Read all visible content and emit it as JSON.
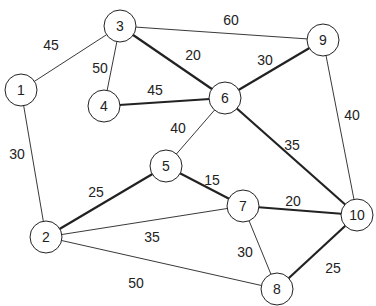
{
  "graph": {
    "nodes": [
      {
        "id": "1",
        "x": 21,
        "y": 90
      },
      {
        "id": "2",
        "x": 46,
        "y": 237
      },
      {
        "id": "3",
        "x": 120,
        "y": 26
      },
      {
        "id": "4",
        "x": 104,
        "y": 106
      },
      {
        "id": "5",
        "x": 166,
        "y": 166
      },
      {
        "id": "6",
        "x": 225,
        "y": 98
      },
      {
        "id": "7",
        "x": 243,
        "y": 206
      },
      {
        "id": "8",
        "x": 277,
        "y": 289
      },
      {
        "id": "9",
        "x": 323,
        "y": 40
      },
      {
        "id": "10",
        "x": 357,
        "y": 215
      }
    ],
    "edges": [
      {
        "from": "1",
        "to": "3",
        "weight": "45",
        "bold": false,
        "lx": 51,
        "ly": 45
      },
      {
        "from": "1",
        "to": "2",
        "weight": "30",
        "bold": false,
        "lx": 17,
        "ly": 154
      },
      {
        "from": "3",
        "to": "4",
        "weight": "50",
        "bold": false,
        "lx": 100,
        "ly": 68
      },
      {
        "from": "3",
        "to": "9",
        "weight": "60",
        "bold": false,
        "lx": 231,
        "ly": 20
      },
      {
        "from": "3",
        "to": "6",
        "weight": "20",
        "bold": true,
        "lx": 193,
        "ly": 55
      },
      {
        "from": "4",
        "to": "6",
        "weight": "45",
        "bold": true,
        "lx": 155,
        "ly": 90
      },
      {
        "from": "6",
        "to": "9",
        "weight": "30",
        "bold": true,
        "lx": 265,
        "ly": 60
      },
      {
        "from": "6",
        "to": "5",
        "weight": "40",
        "bold": false,
        "lx": 178,
        "ly": 128
      },
      {
        "from": "6",
        "to": "10",
        "weight": "35",
        "bold": true,
        "lx": 292,
        "ly": 145
      },
      {
        "from": "9",
        "to": "10",
        "weight": "40",
        "bold": false,
        "lx": 352,
        "ly": 115
      },
      {
        "from": "2",
        "to": "5",
        "weight": "25",
        "bold": true,
        "lx": 96,
        "ly": 192
      },
      {
        "from": "5",
        "to": "7",
        "weight": "15",
        "bold": true,
        "lx": 212,
        "ly": 180
      },
      {
        "from": "2",
        "to": "7",
        "weight": "35",
        "bold": false,
        "lx": 152,
        "ly": 237
      },
      {
        "from": "2",
        "to": "8",
        "weight": "50",
        "bold": false,
        "lx": 136,
        "ly": 283
      },
      {
        "from": "7",
        "to": "10",
        "weight": "20",
        "bold": true,
        "lx": 293,
        "ly": 201
      },
      {
        "from": "7",
        "to": "8",
        "weight": "30",
        "bold": false,
        "lx": 245,
        "ly": 252
      },
      {
        "from": "8",
        "to": "10",
        "weight": "25",
        "bold": true,
        "lx": 333,
        "ly": 268
      }
    ],
    "node_radius": 16,
    "colors": {
      "stroke": "#222222",
      "fill": "#ffffff",
      "text": "#222222"
    }
  }
}
